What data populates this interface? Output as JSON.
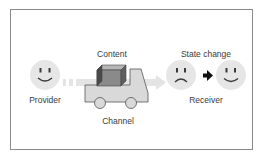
{
  "diagram": {
    "labels": {
      "content": "Content",
      "provider": "Provider",
      "channel": "Channel",
      "state_change": "State change",
      "receiver": "Receiver"
    },
    "nodes": [
      {
        "id": "provider",
        "shape": "smiley-face",
        "mood": "happy"
      },
      {
        "id": "channel",
        "shape": "truck-with-box"
      },
      {
        "id": "receiver-before",
        "shape": "smiley-face",
        "mood": "sad"
      },
      {
        "id": "receiver-after",
        "shape": "smiley-face",
        "mood": "happy"
      }
    ],
    "edges": [
      {
        "from": "provider",
        "to": "receiver-before",
        "style": "faded-dashed-arrow"
      },
      {
        "from": "receiver-before",
        "to": "receiver-after",
        "style": "solid-arrow"
      }
    ],
    "colors": {
      "face_fill": "#e6e6e6",
      "face_features": "#3a3a3a",
      "truck_fill": "#d9d9d9",
      "truck_stroke": "#555555",
      "box_front": "#8a8a8a",
      "box_top": "#b5b5b5",
      "box_side": "#5f5f5f",
      "faded_arrow": "#e3e3e3",
      "border": "#8a8a8a"
    }
  }
}
